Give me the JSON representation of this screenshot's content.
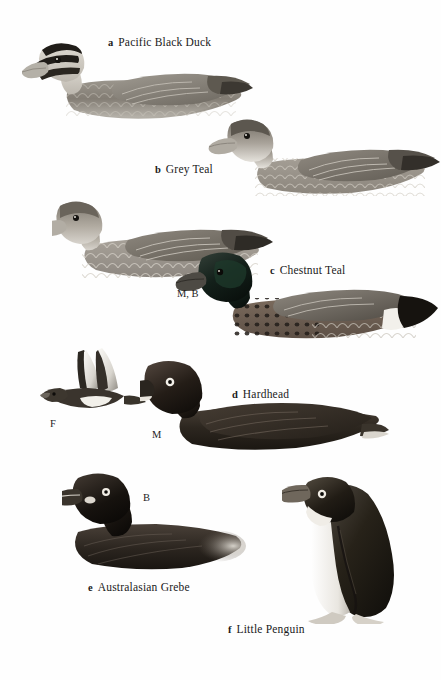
{
  "plate": {
    "background_color": "#ffffff",
    "ink_color": "#1a1a1a",
    "species": [
      {
        "key": "a",
        "name": "Pacific Black Duck",
        "label_x": 108,
        "label_y": 33,
        "illustration": "pacific-black-duck",
        "annotations": []
      },
      {
        "key": "b",
        "name": "Grey Teal",
        "label_x": 155,
        "label_y": 160,
        "illustration": "grey-teal",
        "annotations": []
      },
      {
        "key": "c",
        "name": "Chestnut Teal",
        "label_x": 270,
        "label_y": 261,
        "illustration": "chestnut-teal",
        "annotations": [
          {
            "text": "M, B",
            "x": 177,
            "y": 289
          }
        ]
      },
      {
        "key": "d",
        "name": "Hardhead",
        "label_x": 232,
        "label_y": 385,
        "illustration": "hardhead",
        "annotations": [
          {
            "text": "F",
            "x": 50,
            "y": 419
          },
          {
            "text": "M",
            "x": 152,
            "y": 430
          }
        ]
      },
      {
        "key": "e",
        "name": "Australasian Grebe",
        "label_x": 88,
        "label_y": 578,
        "illustration": "australasian-grebe",
        "annotations": [
          {
            "text": "B",
            "x": 143,
            "y": 493
          }
        ]
      },
      {
        "key": "f",
        "name": "Little Penguin",
        "label_x": 228,
        "label_y": 620,
        "illustration": "little-penguin",
        "annotations": []
      }
    ]
  }
}
